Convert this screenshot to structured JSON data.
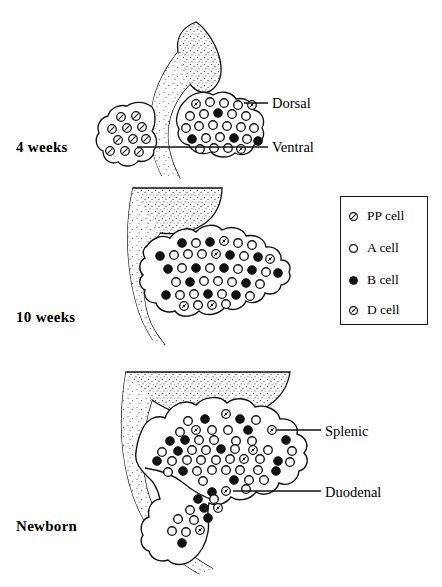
{
  "figure": {
    "background": "#ffffff",
    "ink": "#111111"
  },
  "stages": [
    {
      "id": "four-weeks",
      "label": "4 weeks"
    },
    {
      "id": "ten-weeks",
      "label": "10 weeks"
    },
    {
      "id": "newborn",
      "label": "Newborn"
    }
  ],
  "callouts": [
    {
      "id": "dorsal",
      "label": "Dorsal",
      "stage": "4 weeks"
    },
    {
      "id": "ventral",
      "label": "Ventral",
      "stage": "4 weeks"
    },
    {
      "id": "splenic",
      "label": "Splenic",
      "stage": "Newborn"
    },
    {
      "id": "duodenal",
      "label": "Duodenal",
      "stage": "Newborn"
    }
  ],
  "legend": {
    "items": [
      {
        "key": "pp",
        "label": "PP cell",
        "marker": "circle-slash",
        "fill": "#ffffff",
        "stroke": "#111111"
      },
      {
        "key": "a",
        "label": "A cell",
        "marker": "circle-open",
        "fill": "#ffffff",
        "stroke": "#111111"
      },
      {
        "key": "b",
        "label": "B cell",
        "marker": "circle-filled",
        "fill": "#111111",
        "stroke": "#111111"
      },
      {
        "key": "d",
        "label": "D cell",
        "marker": "circle-dot",
        "fill": "#ffffff",
        "stroke": "#111111"
      }
    ]
  },
  "cell_counts": {
    "four_weeks": {
      "ventral_bud": {
        "pp": 11,
        "a": 0,
        "b": 0,
        "d": 0
      },
      "dorsal_bud": {
        "pp": 0,
        "a": 17,
        "b": 5,
        "d": 4
      }
    },
    "ten_weeks": {
      "pancreas": {
        "pp": 0,
        "a": 24,
        "b": 15,
        "d": 7
      }
    },
    "newborn": {
      "splenic": {
        "pp": 0,
        "a": 33,
        "b": 16,
        "d": 6
      },
      "duodenal": {
        "pp": 0,
        "a": 7,
        "b": 6,
        "d": 3
      }
    }
  }
}
